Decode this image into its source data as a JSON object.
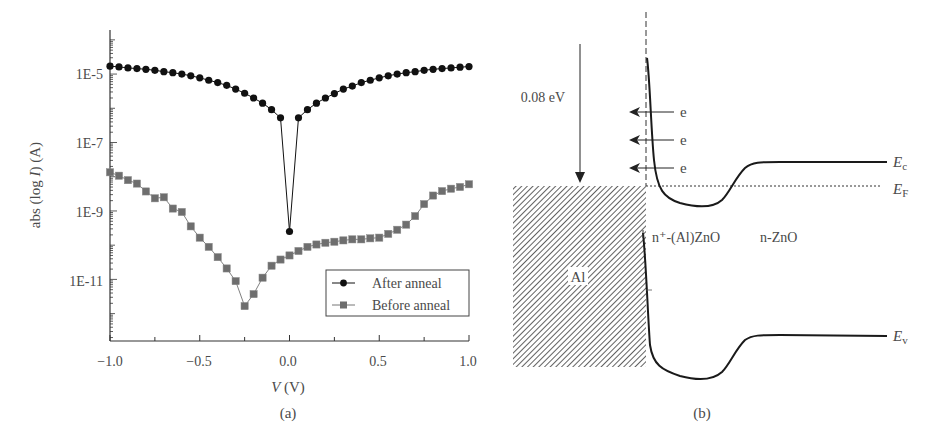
{
  "panel_a": {
    "caption": "(a)",
    "xlabel_var": "V",
    "xlabel_unit": " (V)",
    "ylabel_pre": "abs (log ",
    "ylabel_var": "I",
    "ylabel_post": ") (A)",
    "xticks": [
      "−1.0",
      "−0.5",
      "0.0",
      "0.5",
      "1.0"
    ],
    "yticks": [
      "1E-5",
      "1E-7",
      "1E-9",
      "1E-11"
    ],
    "legend": [
      "After anneal",
      "Before anneal"
    ]
  },
  "panel_b": {
    "caption": "(b)",
    "barrier_label": "0.08 eV",
    "electron_labels": [
      "e",
      "e",
      "e"
    ],
    "metal_label": "Al",
    "region_n_plus": "n⁺-(Al)ZnO",
    "region_n": "n-ZnO",
    "ec_label": "E",
    "ec_sub": "c",
    "ef_label": "E",
    "ef_sub": "F",
    "ev_label": "E",
    "ev_sub": "v"
  },
  "colors": {
    "after_anneal": "#111111",
    "before_anneal": "#6e6e6e",
    "axis": "#333333",
    "text": "#4a4a4a"
  },
  "chart_data": [
    {
      "type": "scatter",
      "title": "(a)",
      "xlabel": "V (V)",
      "ylabel": "abs (log I) (A)",
      "xlim": [
        -1.0,
        1.0
      ],
      "ylim_log10": [
        -12.8,
        -3.8
      ],
      "yscale": "log",
      "xticks": [
        -1.0,
        -0.5,
        0.0,
        0.5,
        1.0
      ],
      "yticks": [
        "1E-5",
        "1E-7",
        "1E-9",
        "1E-11"
      ],
      "legend_position": "lower right",
      "x": [
        -1.0,
        -0.95,
        -0.9,
        -0.85,
        -0.8,
        -0.75,
        -0.7,
        -0.65,
        -0.6,
        -0.55,
        -0.5,
        -0.45,
        -0.4,
        -0.35,
        -0.3,
        -0.25,
        -0.2,
        -0.15,
        -0.1,
        -0.05,
        0.0,
        0.05,
        0.1,
        0.15,
        0.2,
        0.25,
        0.3,
        0.35,
        0.4,
        0.45,
        0.5,
        0.55,
        0.6,
        0.65,
        0.7,
        0.75,
        0.8,
        0.85,
        0.9,
        0.95,
        1.0
      ],
      "series": [
        {
          "name": "After anneal",
          "marker": "circle",
          "log10_values": [
            -4.77,
            -4.79,
            -4.82,
            -4.84,
            -4.86,
            -4.89,
            -4.93,
            -4.96,
            -5.0,
            -5.05,
            -5.11,
            -5.18,
            -5.25,
            -5.33,
            -5.44,
            -5.56,
            -5.7,
            -5.85,
            -6.04,
            -6.28,
            -9.6,
            -6.28,
            -6.04,
            -5.85,
            -5.7,
            -5.57,
            -5.44,
            -5.35,
            -5.25,
            -5.18,
            -5.11,
            -5.05,
            -5.0,
            -4.96,
            -4.93,
            -4.89,
            -4.86,
            -4.84,
            -4.82,
            -4.8,
            -4.78
          ]
        },
        {
          "name": "Before anneal",
          "marker": "square",
          "log10_values": [
            -7.87,
            -7.97,
            -8.1,
            -8.2,
            -8.43,
            -8.63,
            -8.6,
            -8.93,
            -9.03,
            -9.45,
            -9.78,
            -10.05,
            -10.35,
            -10.68,
            -11.05,
            -11.78,
            -11.43,
            -10.95,
            -10.6,
            -10.42,
            -10.3,
            -10.17,
            -10.05,
            -9.98,
            -9.93,
            -9.9,
            -9.86,
            -9.83,
            -9.83,
            -9.8,
            -9.78,
            -9.67,
            -9.55,
            -9.4,
            -9.15,
            -8.8,
            -8.55,
            -8.42,
            -8.35,
            -8.3,
            -8.22
          ]
        }
      ]
    },
    {
      "type": "diagram",
      "title": "(b)",
      "annotations": [
        "0.08 eV",
        "e",
        "e",
        "e",
        "Al",
        "n⁺-(Al)ZnO",
        "n-ZnO",
        "Ec",
        "EF",
        "Ev"
      ]
    }
  ]
}
